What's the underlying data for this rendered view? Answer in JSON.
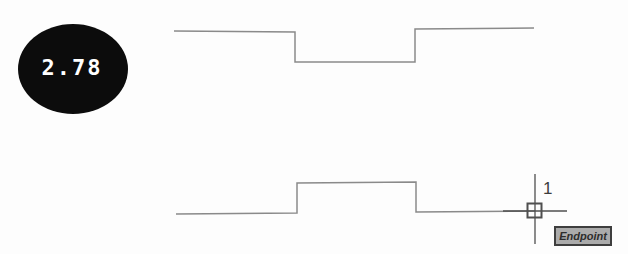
{
  "figure": {
    "background": "#fdfdfd",
    "profile_stroke": "#8a8a8a",
    "cursor_stroke": "#4f4f4f"
  },
  "balloon": {
    "label": "2.78",
    "fill": "#0c0c0c",
    "text_color": "#ffffff"
  },
  "profiles": {
    "top_points": "174,31 295,32 295,62 415,62 415,29 534,28",
    "bottom_points": "176,214 297,213 297,183 416,182 416,212 535,211"
  },
  "cursor": {
    "point_label": "1",
    "vertical_points": "535,174 535,244",
    "horizontal_points": "503,211 567,211",
    "marker": {
      "x": "527.5",
      "y": "203.5",
      "size": "14"
    }
  },
  "tooltip": {
    "text": "Endpoint",
    "background": "#ababab",
    "border_color": "#3e3e3e",
    "text_color": "#2d2d2d"
  }
}
